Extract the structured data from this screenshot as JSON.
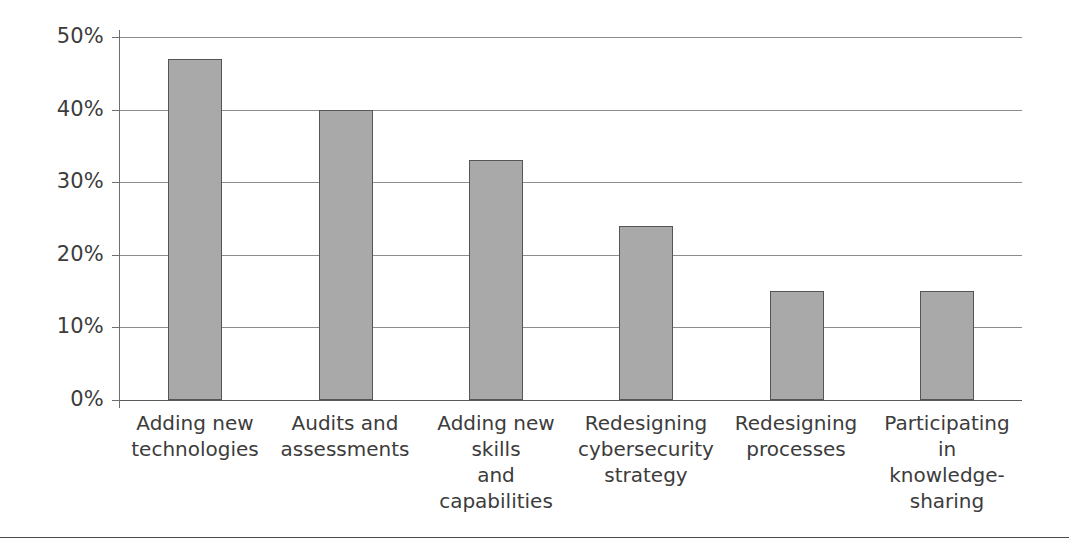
{
  "chart_data": {
    "type": "bar",
    "title": "",
    "subtitle": "",
    "xlabel": "",
    "ylabel": "",
    "ylim": [
      0,
      50
    ],
    "ytick_values": [
      0,
      10,
      20,
      30,
      40,
      50
    ],
    "ytick_labels": [
      "0%",
      "10%",
      "20%",
      "30%",
      "40%",
      "50%"
    ],
    "grid": true,
    "legend": false,
    "orientation": "vertical",
    "categories": [
      "Adding new\ntechnologies",
      "Audits and\nassessments",
      "Adding new\nskills\nand capabilities",
      "Redesigning\ncybersecurity\nstrategy",
      "Redesigning\nprocesses",
      "Participating\nin\nknowledge-\nsharing"
    ],
    "values": [
      47,
      40,
      33,
      24,
      15,
      15
    ],
    "value_labels": [
      "47%",
      "40%",
      "33%",
      "24%",
      "15%",
      "15%"
    ],
    "bar_color": "#a9a9a9",
    "bar_border_color": "#555555",
    "gridline_color": "#8c8c8c",
    "axis_color": "#6e6e6e",
    "text_color": "#3c3c3c"
  }
}
